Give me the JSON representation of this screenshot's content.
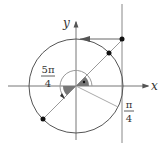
{
  "diagram": {
    "type": "unit-circle",
    "axes": {
      "x_label": "x",
      "y_label": "y"
    },
    "angles": [
      {
        "name": "pi-over-4",
        "numerator": "π",
        "denominator": "4"
      },
      {
        "name": "five-pi-over-4",
        "numerator": "5π",
        "denominator": "4"
      }
    ],
    "points": [
      {
        "name": "tangent-point",
        "description": "intersection of line y=x with vertical line x=1 (top)"
      },
      {
        "name": "circle-point-pi-4",
        "description": "point on circle at angle π/4"
      },
      {
        "name": "circle-point-5pi-4",
        "description": "point on circle at angle 5π/4"
      }
    ],
    "colors": {
      "stroke": "#555555",
      "light_stroke": "#999999",
      "fill_sector": "#777777",
      "point": "#111111"
    }
  }
}
